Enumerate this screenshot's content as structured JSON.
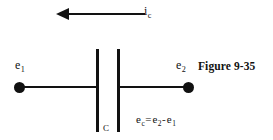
{
  "figure": {
    "caption": "Figure 9-35",
    "type": "capacitor-circuit-diagram",
    "background_color": "#ffffff",
    "ink_color": "#121212"
  },
  "current_arrow": {
    "label_base": "i",
    "label_subscript": "c",
    "direction": "left"
  },
  "terminals": {
    "left": {
      "label_base": "e",
      "label_subscript": "1"
    },
    "right": {
      "label_base": "e",
      "label_subscript": "2"
    }
  },
  "capacitor": {
    "label": "C",
    "plate_count": 2
  },
  "equation": {
    "lhs_base": "e",
    "lhs_subscript": "c",
    "operator_equals": "=",
    "rhs_first_base": "e",
    "rhs_first_subscript": "2",
    "operator_minus": "-",
    "rhs_second_base": "e",
    "rhs_second_subscript": "1"
  }
}
